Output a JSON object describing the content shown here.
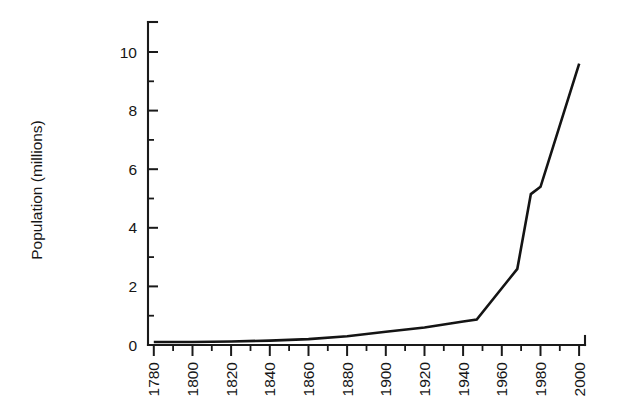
{
  "chart_data": {
    "type": "line",
    "title": "",
    "subtitle": "",
    "xlabel": "",
    "ylabel": "Population (millions)",
    "xlim": [
      1777,
      2003
    ],
    "ylim": [
      0,
      11
    ],
    "grid": false,
    "legend": null,
    "annotations": [],
    "x_tick_labels": [
      "1780",
      "1800",
      "1820",
      "1840",
      "1860",
      "1880",
      "1900",
      "1920",
      "1940",
      "1960",
      "1980",
      "2000"
    ],
    "x_tick_values": [
      1780,
      1800,
      1820,
      1840,
      1860,
      1880,
      1900,
      1920,
      1940,
      1960,
      1980,
      2000
    ],
    "x_minor_tick_values": [
      1790,
      1810,
      1830,
      1850,
      1870,
      1890,
      1910,
      1930,
      1950,
      1970,
      1990
    ],
    "y_tick_labels": [
      "0",
      "2",
      "4",
      "6",
      "8",
      "10"
    ],
    "y_tick_values": [
      0,
      2,
      4,
      6,
      8,
      10
    ],
    "y_minor_tick_values": [
      1,
      3,
      5,
      7,
      9
    ],
    "series": [
      {
        "name": "Population",
        "color": "#141414",
        "x": [
          1780,
          1800,
          1820,
          1840,
          1860,
          1880,
          1900,
          1920,
          1940,
          1947,
          1968,
          1975,
          1980,
          2000
        ],
        "values": [
          0.1,
          0.1,
          0.12,
          0.15,
          0.2,
          0.3,
          0.45,
          0.6,
          0.8,
          0.87,
          2.6,
          5.15,
          5.4,
          9.6
        ]
      }
    ]
  },
  "axis": {
    "y_title": "Population (millions)"
  }
}
